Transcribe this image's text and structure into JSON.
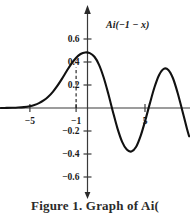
{
  "figure": {
    "curve_label": "Ai(−1 − x)",
    "caption": "Figure 1. Graph of Ai(",
    "line_color": "#111111",
    "axis_color": "#3a3a3a",
    "background": "#ffffff"
  },
  "chart_data": {
    "type": "line",
    "title": "",
    "subtitle": "",
    "xlabel": "",
    "ylabel": "",
    "annotations": [
      {
        "text": "Ai(−1 − x)",
        "x": 2.2,
        "y": 0.6,
        "kind": "curve-label"
      },
      {
        "text": "dashed marker at x = −1",
        "x": -1,
        "y": 0.36,
        "kind": "dashed-vertical"
      }
    ],
    "grid": false,
    "legend": "none",
    "xlim": [
      -7.5,
      8.8
    ],
    "ylim": [
      -0.72,
      0.72
    ],
    "xticks": [
      -5,
      -1,
      5
    ],
    "xtick_labels": [
      "−5",
      "−1",
      "5"
    ],
    "yticks": [
      0.6,
      0.4,
      0.2,
      -0.2,
      -0.4,
      -0.6
    ],
    "ytick_labels": [
      "0.6",
      "0.4",
      "0.2",
      "−0.2",
      "−0.4",
      "−0.6"
    ],
    "series": [
      {
        "name": "Ai(−1 − x)",
        "x": [
          -7.5,
          -7.0,
          -6.5,
          -6.0,
          -5.5,
          -5.0,
          -4.6,
          -4.2,
          -3.8,
          -3.4,
          -3.0,
          -2.6,
          -2.2,
          -1.8,
          -1.4,
          -1.0,
          -0.6,
          -0.2,
          0.2,
          0.6,
          1.0,
          1.4,
          1.8,
          2.2,
          2.6,
          3.0,
          3.4,
          3.8,
          4.2,
          4.6,
          5.0,
          5.4,
          5.8,
          6.2,
          6.6,
          7.0,
          7.4,
          7.8,
          8.2,
          8.6,
          8.8
        ],
        "y": [
          0.0003,
          0.0007,
          0.0017,
          0.0037,
          0.0078,
          0.0158,
          0.0263,
          0.0422,
          0.0654,
          0.0978,
          0.1406,
          0.194,
          0.2559,
          0.3215,
          0.3838,
          0.4353,
          0.4694,
          0.4831,
          0.477,
          0.4456,
          0.3756,
          0.2655,
          0.124,
          -0.0319,
          -0.1791,
          -0.294,
          -0.3614,
          -0.3783,
          -0.3392,
          -0.2421,
          -0.1083,
          0.0401,
          0.1802,
          0.2871,
          0.3405,
          0.3309,
          0.2586,
          0.133,
          -0.0194,
          -0.1759,
          -0.2463
        ],
        "peaks": [
          {
            "x": 0.0,
            "y": 0.536
          },
          {
            "x": 3.3,
            "y": 0.372
          },
          {
            "x": 6.2,
            "y": 0.343
          },
          {
            "x": 8.6,
            "y": 0.33
          }
        ],
        "troughs": [
          {
            "x": 1.7,
            "y": -0.419
          },
          {
            "x": 4.8,
            "y": -0.372
          },
          {
            "x": 7.4,
            "y": -0.35
          }
        ]
      }
    ]
  }
}
